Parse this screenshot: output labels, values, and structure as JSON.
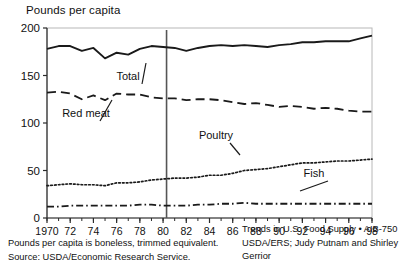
{
  "figure": {
    "y_axis_title": "Pounds per capita",
    "footnotes": {
      "left": [
        "Pounds per capita is boneless, trimmed equivalent.",
        "Source:  USDA/Economic Research Service."
      ],
      "right": [
        "Trends in U.S. Food Supply • AIB-750",
        "USDA/ERS; Judy Putnam and Shirley",
        "Gerrior"
      ]
    }
  },
  "chart_data": {
    "type": "line",
    "title": "",
    "subtitle": "",
    "xlabel": "",
    "ylabel": "Pounds per capita",
    "xlim": [
      1970,
      1998
    ],
    "ylim": [
      0,
      200
    ],
    "yticks": [
      0,
      50,
      100,
      150,
      200
    ],
    "ytick_labels": [
      "0",
      "50",
      "100",
      "150",
      "200"
    ],
    "xticks": [
      1970,
      1972,
      1974,
      1976,
      1978,
      1980,
      1982,
      1984,
      1986,
      1988,
      1990,
      1992,
      1994,
      1996,
      1998
    ],
    "xtick_labels": [
      "1970",
      "72",
      "74",
      "76",
      "78",
      "80",
      "82",
      "84",
      "86",
      "88",
      "90",
      "92",
      "94",
      "96",
      "98"
    ],
    "minor_xticks_every": 1,
    "grid": false,
    "legend": "inline-annotations",
    "x": [
      1970,
      1971,
      1972,
      1973,
      1974,
      1975,
      1976,
      1977,
      1978,
      1979,
      1980,
      1981,
      1982,
      1983,
      1984,
      1985,
      1986,
      1987,
      1988,
      1989,
      1990,
      1991,
      1992,
      1993,
      1994,
      1995,
      1996,
      1997,
      1998
    ],
    "series": [
      {
        "name": "Total",
        "style": "solid",
        "color": "#1a1a1a",
        "values": [
          178,
          181,
          181,
          176,
          179,
          168,
          174,
          172,
          178,
          181,
          180,
          179,
          176,
          179,
          181,
          182,
          181,
          182,
          181,
          180,
          182,
          183,
          185,
          185,
          186,
          186,
          186,
          189,
          192
        ]
      },
      {
        "name": "Red meat",
        "style": "dashed",
        "color": "#1a1a1a",
        "values": [
          132,
          133,
          131,
          125,
          129,
          124,
          131,
          130,
          130,
          127,
          126,
          126,
          124,
          125,
          125,
          124,
          122,
          120,
          121,
          119,
          117,
          118,
          117,
          115,
          116,
          115,
          113,
          112,
          112
        ]
      },
      {
        "name": "Poultry",
        "style": "dotted",
        "color": "#1a1a1a",
        "values": [
          34,
          35,
          36,
          35,
          35,
          34,
          37,
          37,
          38,
          40,
          41,
          42,
          42,
          43,
          45,
          45,
          47,
          50,
          51,
          52,
          54,
          56,
          58,
          58,
          59,
          60,
          60,
          61,
          62
        ]
      },
      {
        "name": "Fish",
        "style": "dash-dot",
        "color": "#1a1a1a",
        "values": [
          12,
          12,
          13,
          13,
          13,
          13,
          13,
          13,
          14,
          14,
          13,
          13,
          13,
          14,
          14,
          15,
          15,
          16,
          15,
          15,
          15,
          15,
          15,
          15,
          15,
          15,
          15,
          15,
          15
        ]
      }
    ],
    "annotations": [
      {
        "label": "Total",
        "x_px": 128,
        "y_px": 80
      },
      {
        "label": "Red meat",
        "x_px": 86,
        "y_px": 117
      },
      {
        "label": "Poultry",
        "x_px": 216,
        "y_px": 139
      },
      {
        "label": "Fish",
        "x_px": 314,
        "y_px": 177
      }
    ],
    "reference_line": {
      "x": 1980.3,
      "orientation": "vertical",
      "color": "#555555"
    }
  }
}
